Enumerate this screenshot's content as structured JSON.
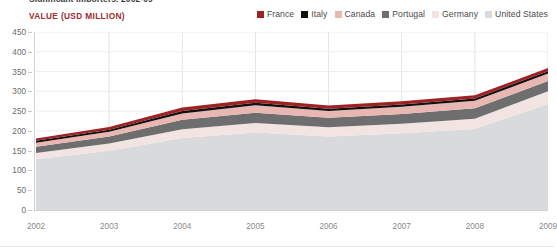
{
  "headline": "Significant Importers, 2002-09",
  "value_caption": "VALUE (USD MILLION)",
  "legend": {
    "items": [
      {
        "label": "France",
        "color": "#9e2123"
      },
      {
        "label": "Italy",
        "color": "#111111"
      },
      {
        "label": "Canada",
        "color": "#e8b7b2"
      },
      {
        "label": "Portugal",
        "color": "#6e6e6e"
      },
      {
        "label": "Germany",
        "color": "#f3e4e4"
      },
      {
        "label": "United States",
        "color": "#d9dadb"
      }
    ]
  },
  "chart_data": {
    "type": "area",
    "stacked": true,
    "title": "Significant Importers, 2002-09",
    "xlabel": "",
    "ylabel": "VALUE (USD MILLION)",
    "ylim": [
      0,
      450
    ],
    "ytick_values": [
      0,
      50,
      100,
      150,
      200,
      250,
      300,
      350,
      400,
      450
    ],
    "ytick_labels": [
      "0",
      "50",
      "100",
      "150",
      "200",
      "250",
      "300",
      "350",
      "400",
      "450"
    ],
    "grid": true,
    "legend_position": "top-right",
    "categories": [
      "2002",
      "2003",
      "2004",
      "2005",
      "2006",
      "2007",
      "2008",
      "2009"
    ],
    "x": [
      2002,
      2003,
      2004,
      2005,
      2006,
      2007,
      2008,
      2009
    ],
    "stack_order_bottom_to_top": [
      "United States",
      "Germany",
      "Portugal",
      "Canada",
      "Italy",
      "France"
    ],
    "series": [
      {
        "name": "United States",
        "color": "#d9dadb",
        "values": [
          128,
          150,
          182,
          196,
          186,
          194,
          205,
          268
        ]
      },
      {
        "name": "Germany",
        "color": "#f3e4e4",
        "values": [
          16,
          18,
          22,
          24,
          23,
          24,
          26,
          32
        ]
      },
      {
        "name": "Portugal",
        "color": "#6e6e6e",
        "values": [
          16,
          18,
          24,
          26,
          24,
          25,
          26,
          26
        ]
      },
      {
        "name": "Canada",
        "color": "#e8b7b2",
        "values": [
          10,
          12,
          16,
          19,
          17,
          18,
          19,
          19
        ]
      },
      {
        "name": "Italy",
        "color": "#111111",
        "values": [
          5,
          5,
          6,
          6,
          6,
          6,
          6,
          6
        ]
      },
      {
        "name": "France",
        "color": "#9e2123",
        "values": [
          6,
          7,
          9,
          9,
          8,
          8,
          8,
          8
        ]
      }
    ],
    "totals": [
      181,
      210,
      259,
      280,
      264,
      275,
      290,
      359
    ]
  }
}
